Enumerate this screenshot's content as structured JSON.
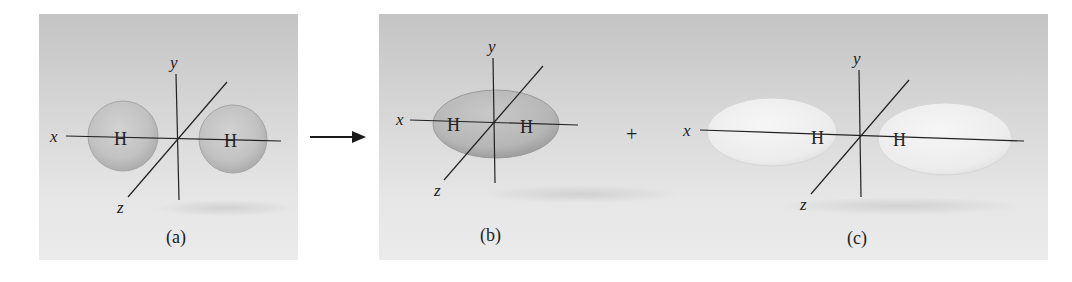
{
  "figure": {
    "panels": [
      {
        "id": "a",
        "caption": "(a)",
        "description": "Two separate hydrogen 1s atomic orbitals (spheres) on x axis"
      },
      {
        "id": "b",
        "caption": "(b)",
        "description": "Bonding molecular orbital - single ellipsoid enclosing both H nuclei"
      },
      {
        "id": "c",
        "caption": "(c)",
        "description": "Antibonding molecular orbital - two separated lobes"
      }
    ],
    "axis_labels": {
      "x": "x",
      "y": "y",
      "z": "z"
    },
    "atom_label": "H",
    "arrow_symbol": "→",
    "plus_symbol": "+"
  },
  "colors": {
    "background_top": "#c4c4c4",
    "background_bottom": "#ebebeb",
    "orbital_bonding": "#b8b8b8",
    "orbital_antibonding": "#eeeeee",
    "line": "#222222"
  }
}
